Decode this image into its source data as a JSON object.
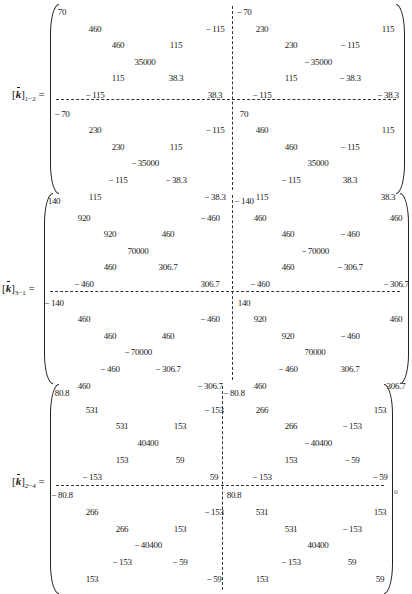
{
  "matrices": [
    {
      "label_main": "k",
      "label_sub": "1-2",
      "equals": "=",
      "rows": [
        [
          "70",
          "",
          "",
          "",
          "",
          "",
          "-70",
          "",
          "",
          "",
          "",
          ""
        ],
        [
          "",
          "460",
          "",
          "",
          "",
          "-115",
          "",
          "230",
          "",
          "",
          "",
          "115"
        ],
        [
          "",
          "",
          "460",
          "",
          "115",
          "",
          "",
          "",
          "230",
          "",
          "-115",
          ""
        ],
        [
          "",
          "",
          "",
          "35000",
          "",
          "",
          "",
          "",
          "",
          "-35000",
          "",
          ""
        ],
        [
          "",
          "",
          "115",
          "",
          "38.3",
          "",
          "",
          "",
          "115",
          "",
          "-38.3",
          ""
        ],
        [
          "",
          "-115",
          "",
          "",
          "",
          "38.3",
          "",
          "-115",
          "",
          "",
          "",
          "-38.3"
        ],
        [
          "-70",
          "",
          "",
          "",
          "",
          "",
          "70",
          "",
          "",
          "",
          "",
          ""
        ],
        [
          "",
          "230",
          "",
          "",
          "",
          "-115",
          "",
          "460",
          "",
          "",
          "",
          "115"
        ],
        [
          "",
          "",
          "230",
          "",
          "115",
          "",
          "",
          "",
          "460",
          "",
          "-115",
          ""
        ],
        [
          "",
          "",
          "",
          "-35000",
          "",
          "",
          "",
          "",
          "",
          "35000",
          "",
          ""
        ],
        [
          "",
          "",
          "-115",
          "",
          "-38.3",
          "",
          "",
          "",
          "-115",
          "",
          "38.3",
          ""
        ],
        [
          "",
          "115",
          "",
          "",
          "",
          "-38.3",
          "",
          "115",
          "",
          "",
          "",
          "38.3"
        ]
      ]
    },
    {
      "label_main": "k",
      "label_sub": "3-1",
      "equals": "=",
      "rows": [
        [
          "140",
          "",
          "",
          "",
          "",
          "",
          "-140",
          "",
          "",
          "",
          "",
          ""
        ],
        [
          "",
          "920",
          "",
          "",
          "",
          "-460",
          "",
          "460",
          "",
          "",
          "",
          "460"
        ],
        [
          "",
          "",
          "920",
          "",
          "460",
          "",
          "",
          "",
          "460",
          "",
          "-460",
          ""
        ],
        [
          "",
          "",
          "",
          "70000",
          "",
          "",
          "",
          "",
          "",
          "-70000",
          "",
          ""
        ],
        [
          "",
          "",
          "460",
          "",
          "306.7",
          "",
          "",
          "",
          "460",
          "",
          "-306.7",
          ""
        ],
        [
          "",
          "-460",
          "",
          "",
          "",
          "306.7",
          "",
          "-460",
          "",
          "",
          "",
          "-306.7"
        ],
        [
          "-140",
          "",
          "",
          "",
          "",
          "",
          "140",
          "",
          "",
          "",
          "",
          ""
        ],
        [
          "",
          "460",
          "",
          "",
          "",
          "-460",
          "",
          "920",
          "",
          "",
          "",
          "460"
        ],
        [
          "",
          "",
          "460",
          "",
          "460",
          "",
          "",
          "",
          "920",
          "",
          "-460",
          ""
        ],
        [
          "",
          "",
          "",
          "-70000",
          "",
          "",
          "",
          "",
          "",
          "70000",
          "",
          ""
        ],
        [
          "",
          "",
          "-460",
          "",
          "-306.7",
          "",
          "",
          "",
          "-460",
          "",
          "306.7",
          ""
        ],
        [
          "",
          "460",
          "",
          "",
          "",
          "-306.7",
          "",
          "460",
          "",
          "",
          "",
          "306.7"
        ]
      ]
    },
    {
      "label_main": "k",
      "label_sub": "2-4",
      "equals": "=",
      "rows": [
        [
          "80.8",
          "",
          "",
          "",
          "",
          "",
          "-80.8",
          "",
          "",
          "",
          "",
          ""
        ],
        [
          "",
          "531",
          "",
          "",
          "",
          "-153",
          "",
          "266",
          "",
          "",
          "",
          "153"
        ],
        [
          "",
          "",
          "531",
          "",
          "153",
          "",
          "",
          "",
          "266",
          "",
          "-153",
          ""
        ],
        [
          "",
          "",
          "",
          "40400",
          "",
          "",
          "",
          "",
          "",
          "-40400",
          "",
          ""
        ],
        [
          "",
          "",
          "153",
          "",
          "59",
          "",
          "",
          "",
          "153",
          "",
          "-59",
          ""
        ],
        [
          "",
          "-153",
          "",
          "",
          "",
          "59",
          "",
          "-153",
          "",
          "",
          "",
          "-59"
        ],
        [
          "-80.8",
          "",
          "",
          "",
          "",
          "",
          "80.8",
          "",
          "",
          "",
          "",
          ""
        ],
        [
          "",
          "266",
          "",
          "",
          "",
          "-153",
          "",
          "531",
          "",
          "",
          "",
          "153"
        ],
        [
          "",
          "",
          "266",
          "",
          "153",
          "",
          "",
          "",
          "531",
          "",
          "-153",
          ""
        ],
        [
          "",
          "",
          "",
          "-40400",
          "",
          "",
          "",
          "",
          "",
          "40400",
          "",
          ""
        ],
        [
          "",
          "",
          "-153",
          "",
          "-59",
          "",
          "",
          "",
          "-153",
          "",
          "59",
          ""
        ],
        [
          "",
          "153",
          "",
          "",
          "",
          "-59",
          "",
          "153",
          "",
          "",
          "",
          "59"
        ]
      ],
      "trailing": "。"
    }
  ]
}
